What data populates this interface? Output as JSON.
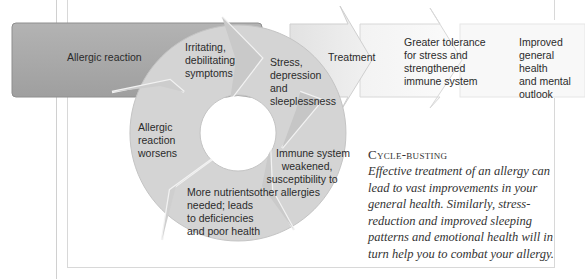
{
  "diagram": {
    "flow": [
      {
        "id": "allergic-reaction",
        "label": "Allergic reaction"
      },
      {
        "id": "treatment",
        "label": "Treatment"
      },
      {
        "id": "greater-tolerance",
        "label": "Greater tolerance\nfor stress and\nstrengthened\nimmune system"
      },
      {
        "id": "improved-health",
        "label": "Improved\ngeneral health\nand mental\noutlook"
      }
    ],
    "cycle": [
      {
        "id": "irritating",
        "lines": [
          "Irritating,",
          "debilitating",
          "symptoms"
        ]
      },
      {
        "id": "stress",
        "lines": [
          "Stress,",
          "depression",
          "and",
          "sleeplessness"
        ]
      },
      {
        "id": "immune",
        "lines": [
          "Immune system",
          "weakened,",
          "susceptibility to",
          "other allergies"
        ]
      },
      {
        "id": "nutrients",
        "lines": [
          "More nutrients",
          "needed; leads",
          "to deficiencies",
          "and poor health"
        ]
      },
      {
        "id": "worsens",
        "lines": [
          "Allergic",
          "reaction",
          "worsens"
        ]
      }
    ]
  },
  "caption": {
    "title_first": "C",
    "title_rest": "ycle-busting",
    "body": "Effective treatment of an allergy can lead to vast improvements in your general health. Similarly, stress-reduction and improved sleeping patterns and emotional health will in turn help you to combat your allergy."
  },
  "colors": {
    "dark_box": "#a9a9a9",
    "cycle_fill": "#d6d6d6",
    "light_arrow": "#ececec",
    "lightest_arrow": "#f6f6f6",
    "frame_line": "#cfcfcf",
    "text": "#2b2b2b"
  }
}
